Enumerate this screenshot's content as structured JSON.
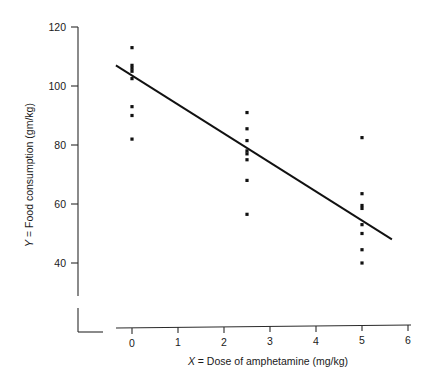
{
  "chart_data": {
    "type": "scatter",
    "title": "",
    "xlabel": "X = Dose of amphetamine (mg/kg)",
    "xlabel_var": "X",
    "xlabel_rest": " = Dose of amphetamine (mg/kg)",
    "ylabel": "Y = Food consumption (gm/kg)",
    "ylabel_var": "Y",
    "ylabel_rest": " = Food consumption (gm/kg)",
    "xlim": [
      0,
      6
    ],
    "ylim": [
      40,
      120
    ],
    "xticks": [
      0,
      1,
      2,
      3,
      4,
      5,
      6
    ],
    "xtick_labels": [
      "0",
      "1",
      "2",
      "3",
      "4",
      "5",
      "6"
    ],
    "yticks": [
      40,
      60,
      80,
      100,
      120
    ],
    "ytick_labels": [
      "40",
      "60",
      "80",
      "100",
      "120"
    ],
    "grid": false,
    "legend": null,
    "axis_break": true,
    "point_color": "#111111",
    "line_color": "#111111",
    "points": [
      {
        "x": 0,
        "y": 113.0
      },
      {
        "x": 0,
        "y": 107.0
      },
      {
        "x": 0,
        "y": 106.0
      },
      {
        "x": 0,
        "y": 105.0
      },
      {
        "x": 0,
        "y": 102.5
      },
      {
        "x": 0,
        "y": 93.0
      },
      {
        "x": 0,
        "y": 90.0
      },
      {
        "x": 0,
        "y": 82.0
      },
      {
        "x": 2.5,
        "y": 91.0
      },
      {
        "x": 2.5,
        "y": 85.5
      },
      {
        "x": 2.5,
        "y": 81.5
      },
      {
        "x": 2.5,
        "y": 78.0
      },
      {
        "x": 2.5,
        "y": 77.0
      },
      {
        "x": 2.5,
        "y": 75.0
      },
      {
        "x": 2.5,
        "y": 68.0
      },
      {
        "x": 2.5,
        "y": 56.5
      },
      {
        "x": 5,
        "y": 82.5
      },
      {
        "x": 5,
        "y": 63.5
      },
      {
        "x": 5,
        "y": 59.5
      },
      {
        "x": 5,
        "y": 58.5
      },
      {
        "x": 5,
        "y": 53.0
      },
      {
        "x": 5,
        "y": 50.0
      },
      {
        "x": 5,
        "y": 44.5
      },
      {
        "x": 5,
        "y": 40.0
      }
    ],
    "fit_line": {
      "name": "least-squares regression line",
      "x_start": -0.35,
      "y_start": 107.0,
      "x_end": 5.65,
      "y_end": 48.0
    }
  }
}
